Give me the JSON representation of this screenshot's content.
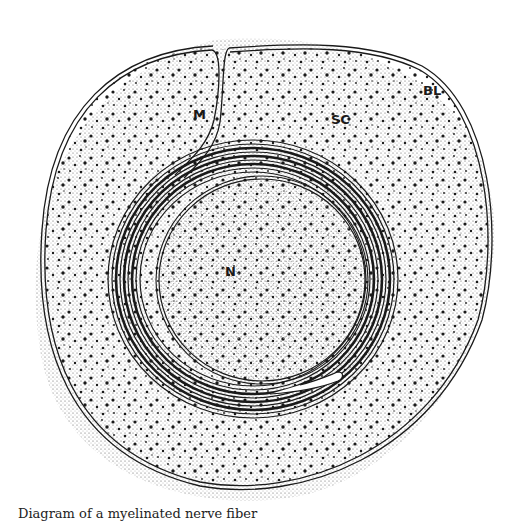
{
  "diagram": {
    "type": "schematic cross-section",
    "labels": {
      "mesaxon": "M",
      "schwann_cell": "SC",
      "basal_lamina": "BL",
      "axon": "N"
    },
    "caption": "Diagram of a myelinated nerve fiber",
    "colors": {
      "line": "#1a1a1a",
      "background": "#ffffff",
      "stipple": "#333333"
    }
  }
}
